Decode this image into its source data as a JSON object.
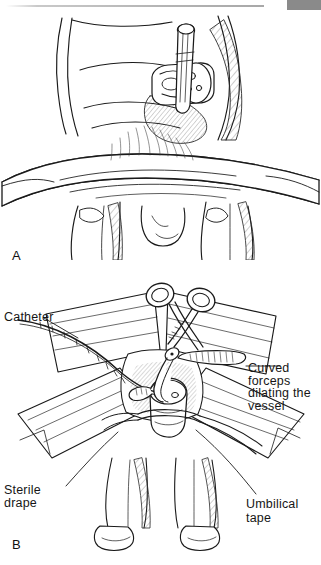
{
  "page": {
    "width": 321,
    "height": 565,
    "background": "#ffffff",
    "ink_color": "#1a1a1a",
    "header_rule_color": "#b4b4b4",
    "header_block_color": "#8a8a8a"
  },
  "figure": {
    "type": "medical-line-illustration",
    "panels": [
      {
        "letter": "A",
        "description": "Infant supine with umbilical cord stump and cord clamp, restraint band across abdomen"
      },
      {
        "letter": "B",
        "description": "Sterile drapes around umbilical stump, curved forceps dilating vessel, catheter advanced, umbilical tape at base"
      }
    ],
    "labels": {
      "catheter": "Catheter",
      "curved_forceps": "Curved forceps\ndilating the\nvessel",
      "curved_forceps_lines": [
        "Curved forceps",
        "dilating the",
        "vessel"
      ],
      "sterile_drape_lines": [
        "Sterile",
        "drape"
      ],
      "umbilical_tape": "Umbilical tape"
    }
  }
}
